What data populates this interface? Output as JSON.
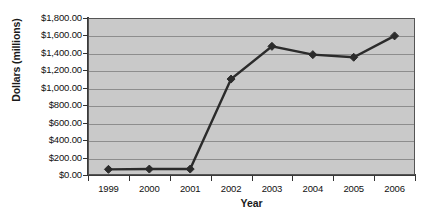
{
  "chart_data": {
    "type": "line",
    "title": "",
    "xlabel": "Year",
    "ylabel": "Dollars (millions)",
    "categories": [
      "1999",
      "2000",
      "2001",
      "2002",
      "2003",
      "2004",
      "2005",
      "2006"
    ],
    "values": [
      65,
      68,
      68,
      1100,
      1475,
      1380,
      1350,
      1595
    ],
    "series": [
      {
        "name": "Dollars (millions)",
        "values": [
          65,
          68,
          68,
          1100,
          1475,
          1380,
          1350,
          1595
        ]
      }
    ],
    "ylim": [
      0,
      1800
    ],
    "ytick_values": [
      0,
      200,
      400,
      600,
      800,
      1000,
      1200,
      1400,
      1600,
      1800
    ],
    "ytick_labels": [
      "$0.00",
      "$200.00",
      "$400.00",
      "$600.00",
      "$800.00",
      "$1,000.00",
      "$1,200.00",
      "$1,400.00",
      "$1,600.00",
      "$1,800.00"
    ],
    "grid": true,
    "legend": false,
    "legend_position": "none",
    "marker": "diamond",
    "colors": {
      "plot_background": "#c9c9c9",
      "gridline": "#8d8d8d",
      "series_line": "#2b2b2b",
      "marker_fill": "#2b2b2b",
      "axis": "#3a3a3a",
      "text": "#111111"
    }
  }
}
